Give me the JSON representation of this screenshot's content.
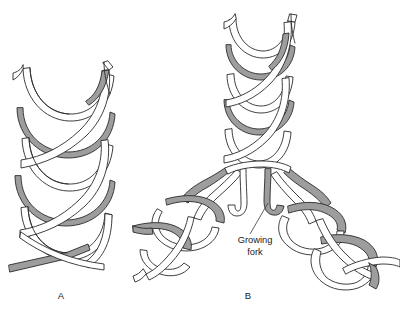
{
  "figure": {
    "background_color": "#ffffff",
    "width": 400,
    "height": 311
  },
  "style": {
    "ribbon_front_color": "#ffffff",
    "ribbon_back_color": "#9d9d9d",
    "outline_color": "#2a2a2a",
    "text_color": "#1a1a1a",
    "leader_color": "#3a3a3a"
  },
  "panels": [
    {
      "id": "panel-a",
      "label": "A",
      "label_x": 61,
      "label_y": 299,
      "description": "Intact parental DNA double helix, two antiparallel ribbons wound around a common axis"
    },
    {
      "id": "panel-b",
      "label": "B",
      "label_x": 248,
      "label_y": 299,
      "description": "Replicating DNA showing a growing fork where the parental helix separates into two daughter helices"
    }
  ],
  "annotations": [
    {
      "id": "growing-fork",
      "line1": "Growing",
      "line2": "fork",
      "text_x": 255,
      "text_y1": 243,
      "text_y2": 255,
      "leader": {
        "x1": 250,
        "y1": 234,
        "x2": 268,
        "y2": 203
      }
    }
  ]
}
